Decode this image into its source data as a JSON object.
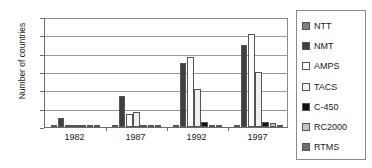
{
  "chart_data": {
    "type": "bar",
    "title": "",
    "xlabel": "",
    "ylabel": "Number of countries",
    "categories": [
      "1982",
      "1987",
      "1992",
      "1997"
    ],
    "ylim": [
      0,
      60
    ],
    "yticks": [
      0,
      10,
      20,
      30,
      40,
      50,
      60
    ],
    "grid": true,
    "legend_position": "right",
    "series": [
      {
        "name": "NTT",
        "color": "#808080",
        "values": [
          1,
          1,
          1,
          1
        ]
      },
      {
        "name": "NMT",
        "color": "#404040",
        "values": [
          5,
          17,
          35,
          45
        ]
      },
      {
        "name": "AMPS",
        "color": "#ffffff",
        "values": [
          0,
          7,
          38,
          51
        ]
      },
      {
        "name": "TACS",
        "color": "#f0f0f0",
        "values": [
          0,
          8,
          21,
          30
        ]
      },
      {
        "name": "C-450",
        "color": "#111111",
        "values": [
          1,
          1,
          3,
          3
        ]
      },
      {
        "name": "RC2000",
        "color": "#c4c4c4",
        "values": [
          0,
          0,
          0,
          2
        ]
      },
      {
        "name": "RTMS",
        "color": "#6e6e6e",
        "values": [
          1,
          1,
          1,
          1
        ]
      }
    ]
  },
  "legend": {
    "items": [
      {
        "label": "NTT"
      },
      {
        "label": "NMT"
      },
      {
        "label": "AMPS"
      },
      {
        "label": "TACS"
      },
      {
        "label": "C-450"
      },
      {
        "label": "RC2000"
      },
      {
        "label": "RTMS"
      }
    ]
  }
}
